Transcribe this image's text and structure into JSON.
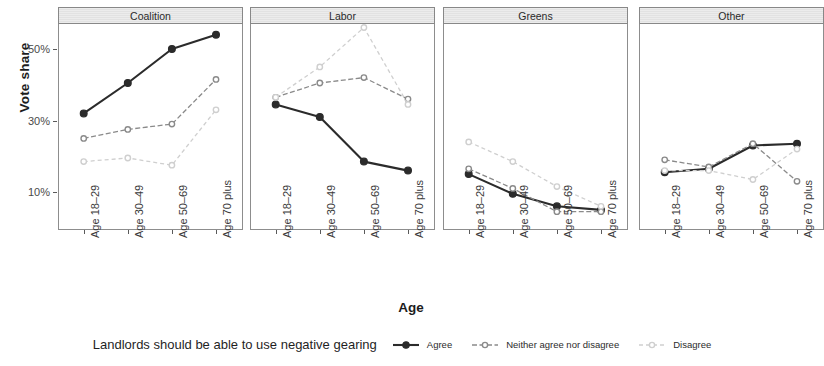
{
  "axis": {
    "y_title": "Vote share",
    "x_title": "Age",
    "y_ticks": [
      "50%",
      "30%",
      "10%"
    ],
    "x_ticks": [
      "Age 18–29",
      "Age 30–49",
      "Age 50–69",
      "Age 70 plus"
    ]
  },
  "panels": [
    {
      "label": "Coalition"
    },
    {
      "label": "Labor"
    },
    {
      "label": "Greens"
    },
    {
      "label": "Other"
    }
  ],
  "legend": {
    "title": "Landlords should be able to use negative gearing",
    "items": [
      {
        "label": "Agree",
        "color": "#2b2b2b",
        "style": "solid"
      },
      {
        "label": "Neither agree nor disagree",
        "color": "#8a8a8a",
        "style": "dashed"
      },
      {
        "label": "Disagree",
        "color": "#cfcfcf",
        "style": "dashed"
      }
    ]
  },
  "chart_data": {
    "type": "line",
    "title": "",
    "subtitle": "",
    "xlabel": "Age",
    "ylabel": "Vote share",
    "ylim": [
      0,
      60
    ],
    "y_tick_values": [
      50,
      30,
      10
    ],
    "grid": false,
    "legend_position": "bottom",
    "legend_title": "Landlords should be able to use negative gearing",
    "facet_variable": "Party",
    "categories": [
      "Age 18–29",
      "Age 30–49",
      "Age 50–69",
      "Age 70 plus"
    ],
    "facets": [
      {
        "name": "Coalition",
        "series": [
          {
            "name": "Agree",
            "color": "#2b2b2b",
            "values": [
              32.0,
              40.5,
              50.0,
              54.0
            ]
          },
          {
            "name": "Neither agree nor disagree",
            "color": "#8a8a8a",
            "values": [
              25.0,
              27.5,
              29.0,
              41.5
            ]
          },
          {
            "name": "Disagree",
            "color": "#cfcfcf",
            "values": [
              18.5,
              19.5,
              17.5,
              33.0
            ]
          }
        ]
      },
      {
        "name": "Labor",
        "series": [
          {
            "name": "Agree",
            "color": "#2b2b2b",
            "values": [
              34.5,
              31.0,
              18.5,
              16.0
            ]
          },
          {
            "name": "Neither agree nor disagree",
            "color": "#8a8a8a",
            "values": [
              36.5,
              40.5,
              42.0,
              36.0
            ]
          },
          {
            "name": "Disagree",
            "color": "#cfcfcf",
            "values": [
              36.5,
              45.0,
              56.0,
              34.5
            ]
          }
        ]
      },
      {
        "name": "Greens",
        "series": [
          {
            "name": "Agree",
            "color": "#2b2b2b",
            "values": [
              15.0,
              9.5,
              6.0,
              5.0
            ]
          },
          {
            "name": "Neither agree nor disagree",
            "color": "#8a8a8a",
            "values": [
              16.5,
              11.0,
              4.5,
              4.5
            ]
          },
          {
            "name": "Disagree",
            "color": "#cfcfcf",
            "values": [
              24.0,
              18.5,
              11.5,
              6.0
            ]
          }
        ]
      },
      {
        "name": "Other",
        "series": [
          {
            "name": "Agree",
            "color": "#2b2b2b",
            "values": [
              15.5,
              16.5,
              23.0,
              23.5
            ]
          },
          {
            "name": "Neither agree nor disagree",
            "color": "#8a8a8a",
            "values": [
              19.0,
              17.0,
              23.5,
              13.0
            ]
          },
          {
            "name": "Disagree",
            "color": "#cfcfcf",
            "values": [
              16.0,
              16.0,
              13.5,
              22.0
            ]
          }
        ]
      }
    ]
  },
  "layout": {
    "panel_lefts": [
      58,
      250,
      443,
      639
    ],
    "panel_width": 185,
    "panel_top": 7,
    "panel_height": 223,
    "strip_height": 17,
    "y_px_50": 49,
    "y_px_per_20pct": 71.5
  }
}
